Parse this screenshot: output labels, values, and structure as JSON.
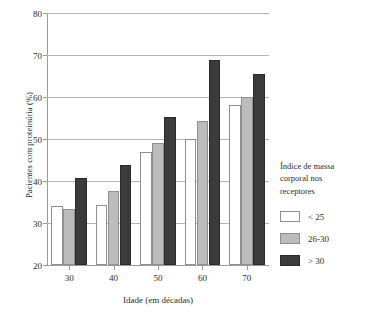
{
  "chart_data": {
    "type": "bar",
    "title": "",
    "xlabel": "Idade (em décadas)",
    "ylabel": "Pacientes com proteinúria (%)",
    "categories": [
      "30",
      "40",
      "50",
      "60",
      "70"
    ],
    "ylim": [
      20,
      80
    ],
    "yticks": [
      20,
      30,
      40,
      50,
      60,
      70,
      80
    ],
    "grid": true,
    "legend_position": "right",
    "legend_title": "Índice de massa corporal nos receptores",
    "series": [
      {
        "name": "< 25",
        "color": "#ffffff",
        "values": [
          34.0,
          34.3,
          47.0,
          50.0,
          58.2
        ]
      },
      {
        "name": "26-30",
        "color": "#bcbcbc",
        "values": [
          33.4,
          37.7,
          49.0,
          54.4,
          60.0
        ]
      },
      {
        "name": "> 30",
        "color": "#3b3b3b",
        "values": [
          40.8,
          43.8,
          55.2,
          68.8,
          65.4
        ]
      }
    ]
  },
  "axis": {
    "ytick_labels": [
      "80",
      "70",
      "60",
      "50",
      "40",
      "30",
      "20"
    ],
    "xtick_labels": [
      "30",
      "40",
      "50",
      "60",
      "70"
    ]
  },
  "legend": {
    "title_line1": "Índice de massa",
    "title_line2": "corporal nos",
    "title_line3": "receptores",
    "items": [
      {
        "label": "< 25"
      },
      {
        "label": "26-30"
      },
      {
        "label": "> 30"
      }
    ]
  }
}
